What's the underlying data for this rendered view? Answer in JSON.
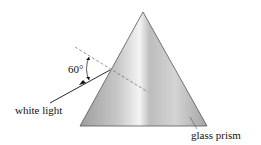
{
  "diagram": {
    "labels": {
      "angle": "60°",
      "incident_ray": "white light",
      "prism": "glass prism"
    },
    "colors": {
      "prism_edge": "#555555",
      "prism_fill_dark": "#a9a9a9",
      "prism_fill_light": "#f2f2f2",
      "normal_line": "#666666",
      "ray": "#111111"
    }
  }
}
